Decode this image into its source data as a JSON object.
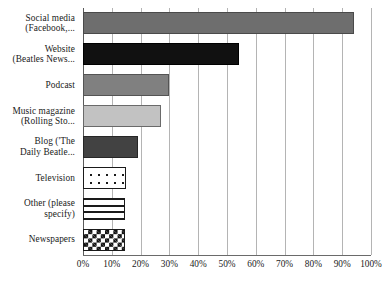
{
  "chart_data": {
    "type": "bar",
    "orientation": "horizontal",
    "title": "",
    "xlabel": "",
    "ylabel": "",
    "xlim": [
      0,
      100
    ],
    "grid": true,
    "legend": "none",
    "x_tick_labels": [
      "0%",
      "10%",
      "20%",
      "30%",
      "40%",
      "50%",
      "60%",
      "70%",
      "80%",
      "90%",
      "100%"
    ],
    "x_tick_values": [
      0,
      10,
      20,
      30,
      40,
      50,
      60,
      70,
      80,
      90,
      100
    ],
    "categories": [
      "Social media\n(Facebook,...",
      "Website\n(Beatles News...",
      "Podcast",
      "Music magazine\n(Rolling Sto...",
      "Blog ('The\nDaily Beatle...",
      "Television",
      "Other (please\nspecify)",
      "Newspapers"
    ],
    "values": [
      94,
      54,
      30,
      27,
      19,
      15,
      14.5,
      14.5
    ],
    "bars": [
      {
        "label": "Social media\n(Facebook,...",
        "value": 94,
        "fill": "fill-mediumgray",
        "pattern": "solid-medium-gray",
        "color": "#6e6e6e"
      },
      {
        "label": "Website\n(Beatles News...",
        "value": 54,
        "fill": "fill-black",
        "pattern": "solid-black",
        "color": "#111111"
      },
      {
        "label": "Podcast",
        "value": 30,
        "fill": "fill-gray",
        "pattern": "solid-gray",
        "color": "#808080"
      },
      {
        "label": "Music magazine\n(Rolling Sto...",
        "value": 27,
        "fill": "fill-lightgray",
        "pattern": "solid-light-gray",
        "color": "#c2c2c2"
      },
      {
        "label": "Blog ('The\nDaily Beatle...",
        "value": 19,
        "fill": "fill-darkgray",
        "pattern": "solid-dark-gray",
        "color": "#424242"
      },
      {
        "label": "Television",
        "value": 15,
        "fill": "fill-dots",
        "pattern": "dotted",
        "color": "#ffffff"
      },
      {
        "label": "Other (please\nspecify)",
        "value": 14.5,
        "fill": "fill-hlines",
        "pattern": "horizontal-lines",
        "color": "#ffffff"
      },
      {
        "label": "Newspapers",
        "value": 14.5,
        "fill": "fill-checker",
        "pattern": "checkerboard",
        "color": "#ffffff"
      }
    ]
  }
}
